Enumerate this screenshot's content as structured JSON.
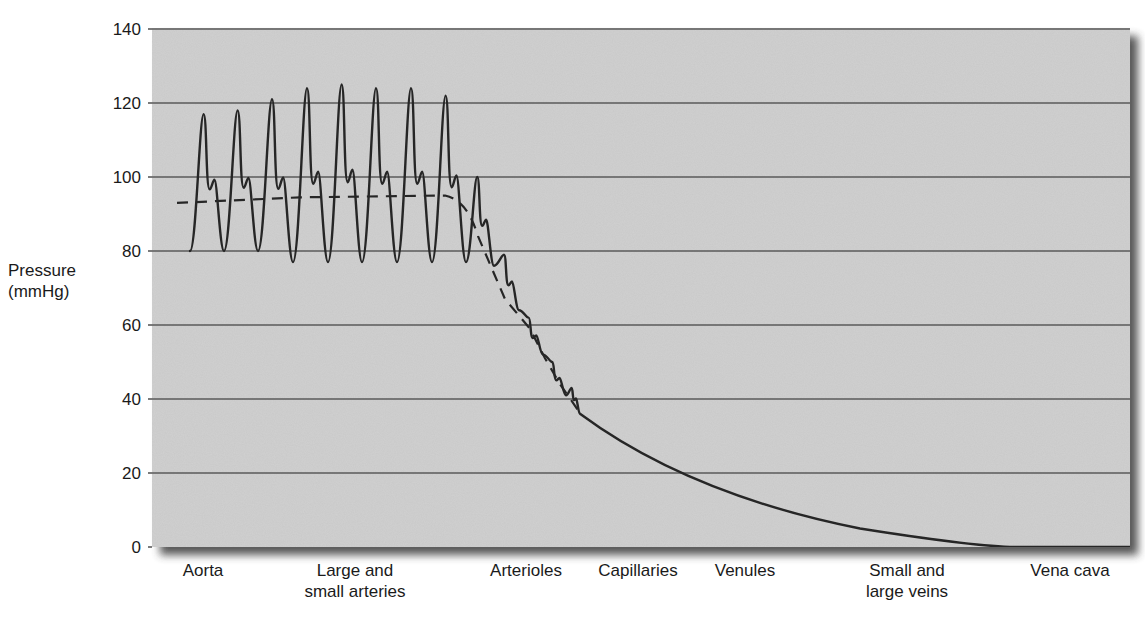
{
  "chart_data": {
    "type": "line",
    "title": "",
    "xlabel": "",
    "ylabel": "Pressure (mmHg)",
    "ylabel_lines": [
      "Pressure",
      "(mmHg)"
    ],
    "ylim": [
      0,
      140
    ],
    "yticks": [
      0,
      20,
      40,
      60,
      80,
      100,
      120,
      140
    ],
    "grid": true,
    "legend": "none",
    "categories": [
      {
        "label_lines": [
          "Aorta"
        ],
        "x_px": 203
      },
      {
        "label_lines": [
          "Large and",
          "small arteries"
        ],
        "x_px": 355
      },
      {
        "label_lines": [
          "Arterioles"
        ],
        "x_px": 526
      },
      {
        "label_lines": [
          "Capillaries"
        ],
        "x_px": 638
      },
      {
        "label_lines": [
          "Venules"
        ],
        "x_px": 745
      },
      {
        "label_lines": [
          "Small and",
          "large veins"
        ],
        "x_px": 907
      },
      {
        "label_lines": [
          "Vena cava"
        ],
        "x_px": 1070
      }
    ],
    "series": [
      {
        "name": "Pulsatile pressure",
        "style": "solid",
        "pulses": [
          {
            "region": "Aorta",
            "systolic": 117,
            "diastolic": 80
          },
          {
            "region": "Aorta",
            "systolic": 118,
            "diastolic": 80
          },
          {
            "region": "Large and small arteries",
            "systolic": 121,
            "diastolic": 77
          },
          {
            "region": "Large and small arteries",
            "systolic": 124,
            "diastolic": 77
          },
          {
            "region": "Large and small arteries",
            "systolic": 125,
            "diastolic": 77
          },
          {
            "region": "Large and small arteries",
            "systolic": 124,
            "diastolic": 77
          },
          {
            "region": "Large and small arteries",
            "systolic": 124,
            "diastolic": 77
          },
          {
            "region": "Large and small arteries",
            "systolic": 122,
            "diastolic": 77
          },
          {
            "region": "Arterioles",
            "systolic": 100,
            "diastolic": 76
          },
          {
            "region": "Arterioles",
            "systolic": 79,
            "diastolic": 64
          },
          {
            "region": "Arterioles",
            "systolic": 62,
            "diastolic": 52
          },
          {
            "region": "Arterioles",
            "systolic": 50,
            "diastolic": 41
          },
          {
            "region": "Arterioles",
            "systolic": 43,
            "diastolic": 37
          }
        ],
        "decay_points": [
          {
            "region": "Arterioles",
            "value": 36
          },
          {
            "region": "Capillaries",
            "value": 25
          },
          {
            "region": "Venules",
            "value": 15
          },
          {
            "region": "Small and large veins",
            "value": 5
          },
          {
            "region": "Vena cava",
            "value": 0
          }
        ]
      },
      {
        "name": "Mean pressure",
        "style": "dashed",
        "points": [
          {
            "region": "Aorta",
            "value": 93
          },
          {
            "region": "Large and small arteries",
            "value": 95
          },
          {
            "region": "Arterioles (start)",
            "value": 91
          },
          {
            "region": "Arterioles",
            "value": 67
          },
          {
            "region": "Arterioles (end)",
            "value": 37
          }
        ]
      }
    ]
  },
  "colors": {
    "plot_background": "#c9c9c9",
    "gridline": "#5a5a5a",
    "trace": "#262626",
    "shadow": "#3a3a3a",
    "text": "#1a1a1a"
  }
}
